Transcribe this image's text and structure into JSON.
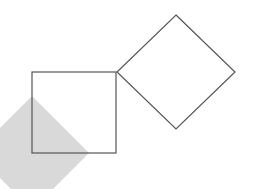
{
  "canvas": {
    "width": 255,
    "height": 189,
    "background": "#ffffff"
  },
  "shapes": {
    "shaded_diamond": {
      "points": "32,96 89,153 32,210 -25,153",
      "fill": "#d9d9d9"
    },
    "square": {
      "x": 32,
      "y": 72,
      "width": 84,
      "height": 81,
      "stroke": "#555555"
    },
    "diamond": {
      "points": "176,15 235,72 176,129 117,72",
      "stroke": "#555555"
    }
  }
}
